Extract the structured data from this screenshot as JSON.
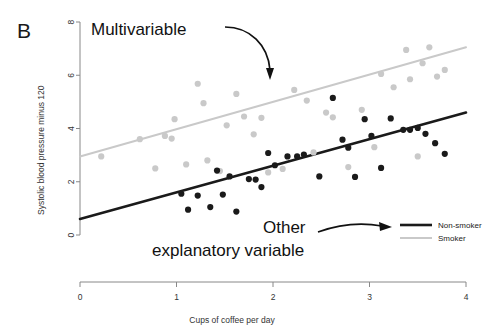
{
  "panel": {
    "label": "B"
  },
  "annotations": {
    "multivariable": "Multivariable",
    "other_line1": "Other",
    "other_line2": "explanatory variable"
  },
  "legend": {
    "position": "bottom-right",
    "items": [
      {
        "label": "Non-smoker",
        "color": "#1a1a1a",
        "width": 2.6
      },
      {
        "label": "Smoker",
        "color": "#c9c9c9",
        "width": 2.0
      }
    ]
  },
  "chart_data": {
    "type": "scatter",
    "title": "",
    "subtitle": "",
    "xlabel": "Cups of coffee per day",
    "ylabel": "Systolic blood pressure minus 120",
    "xlim": [
      0,
      4
    ],
    "ylim": [
      0,
      8
    ],
    "xticks": [
      0,
      1,
      2,
      3,
      4
    ],
    "yticks": [
      0,
      2,
      4,
      6,
      8
    ],
    "xtick_labels": [
      "0",
      "1",
      "2",
      "3",
      "4"
    ],
    "ytick_labels": [
      "0",
      "2",
      "4",
      "6",
      "8"
    ],
    "grid": false,
    "legend_position": "bottom-right",
    "point_colors": {
      "non_smoker": "#1a1a1a",
      "smoker": "#c9c9c9"
    },
    "series": [
      {
        "name": "Smoker",
        "color": "#c9c9c9",
        "marker": "circle",
        "points": [
          [
            0.22,
            2.95
          ],
          [
            0.62,
            3.6
          ],
          [
            0.78,
            2.5
          ],
          [
            0.88,
            3.72
          ],
          [
            0.95,
            3.62
          ],
          [
            0.98,
            4.35
          ],
          [
            1.1,
            2.65
          ],
          [
            1.22,
            5.68
          ],
          [
            1.28,
            4.95
          ],
          [
            1.32,
            2.8
          ],
          [
            1.45,
            2.4
          ],
          [
            1.52,
            4.12
          ],
          [
            1.62,
            5.3
          ],
          [
            1.7,
            4.45
          ],
          [
            1.8,
            3.78
          ],
          [
            1.88,
            4.4
          ],
          [
            1.95,
            2.35
          ],
          [
            2.1,
            2.48
          ],
          [
            2.22,
            5.45
          ],
          [
            2.35,
            5.05
          ],
          [
            2.42,
            3.1
          ],
          [
            2.55,
            4.6
          ],
          [
            2.62,
            4.42
          ],
          [
            2.78,
            2.55
          ],
          [
            2.92,
            4.7
          ],
          [
            3.05,
            3.3
          ],
          [
            3.12,
            6.05
          ],
          [
            3.25,
            5.55
          ],
          [
            3.38,
            6.95
          ],
          [
            3.42,
            5.85
          ],
          [
            3.5,
            2.95
          ],
          [
            3.55,
            6.45
          ],
          [
            3.62,
            7.05
          ],
          [
            3.7,
            5.95
          ],
          [
            3.78,
            6.2
          ]
        ],
        "fit_line": {
          "x": [
            0.0,
            4.0
          ],
          "y": [
            2.95,
            7.05
          ]
        }
      },
      {
        "name": "Non-smoker",
        "color": "#1a1a1a",
        "marker": "circle",
        "points": [
          [
            1.05,
            1.55
          ],
          [
            1.12,
            0.95
          ],
          [
            1.22,
            1.48
          ],
          [
            1.35,
            1.05
          ],
          [
            1.42,
            2.42
          ],
          [
            1.48,
            1.52
          ],
          [
            1.55,
            2.2
          ],
          [
            1.62,
            0.88
          ],
          [
            1.75,
            2.1
          ],
          [
            1.82,
            2.08
          ],
          [
            1.88,
            1.8
          ],
          [
            1.95,
            3.08
          ],
          [
            2.02,
            2.62
          ],
          [
            2.15,
            2.95
          ],
          [
            2.25,
            2.95
          ],
          [
            2.32,
            3.02
          ],
          [
            2.48,
            2.2
          ],
          [
            2.62,
            5.15
          ],
          [
            2.72,
            3.58
          ],
          [
            2.78,
            3.28
          ],
          [
            2.85,
            2.18
          ],
          [
            2.95,
            4.35
          ],
          [
            3.02,
            3.72
          ],
          [
            3.12,
            2.52
          ],
          [
            3.22,
            4.38
          ],
          [
            3.35,
            3.95
          ],
          [
            3.42,
            3.95
          ],
          [
            3.5,
            4.02
          ],
          [
            3.58,
            3.8
          ],
          [
            3.68,
            3.45
          ],
          [
            3.78,
            3.05
          ]
        ],
        "fit_line": {
          "x": [
            0.0,
            4.0
          ],
          "y": [
            0.6,
            4.6
          ]
        }
      }
    ]
  }
}
